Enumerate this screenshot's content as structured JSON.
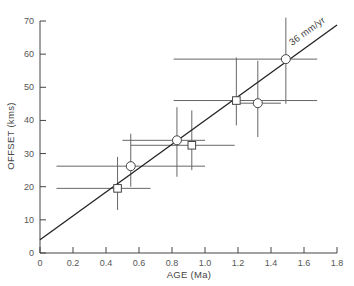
{
  "chart_data": {
    "type": "scatter",
    "title": "",
    "xlabel": "AGE (Ma)",
    "ylabel": "OFFSET (kms)",
    "xlim": [
      0,
      1.8
    ],
    "ylim": [
      0,
      70
    ],
    "xticks": [
      "0",
      "0.2",
      "0.4",
      "0.6",
      "0.8",
      "1.0",
      "1.2",
      "1.4",
      "1.6",
      "1.8"
    ],
    "yticks": [
      "0",
      "10",
      "20",
      "30",
      "40",
      "50",
      "60",
      "70"
    ],
    "grid": false,
    "fit_line": {
      "label": "36 mm/yr",
      "intercept": 4,
      "slope": 36,
      "x_range": [
        0,
        1.8
      ]
    },
    "series": [
      {
        "name": "circles",
        "marker": "circle",
        "points": [
          {
            "x": 0.55,
            "y": 26.2,
            "xerr": [
              0.1,
              1.0
            ],
            "yerr": [
              20,
              36
            ]
          },
          {
            "x": 0.83,
            "y": 34.0,
            "xerr": [
              0.5,
              1.0
            ],
            "yerr": [
              23,
              44
            ]
          },
          {
            "x": 1.32,
            "y": 45.2,
            "xerr": [
              1.17,
              1.46
            ],
            "yerr": [
              35,
              58
            ]
          },
          {
            "x": 1.49,
            "y": 58.5,
            "xerr": [
              0.81,
              1.68
            ],
            "yerr": [
              45,
              71
            ]
          }
        ]
      },
      {
        "name": "squares",
        "marker": "square",
        "points": [
          {
            "x": 0.47,
            "y": 19.5,
            "xerr": [
              0.1,
              0.67
            ],
            "yerr": [
              13,
              29
            ]
          },
          {
            "x": 0.92,
            "y": 32.5,
            "xerr": [
              0.55,
              1.18
            ],
            "yerr": [
              25,
              43
            ]
          },
          {
            "x": 1.19,
            "y": 46.0,
            "xerr": [
              0.81,
              1.68
            ],
            "yerr": [
              38.5,
              59
            ]
          }
        ]
      }
    ]
  }
}
